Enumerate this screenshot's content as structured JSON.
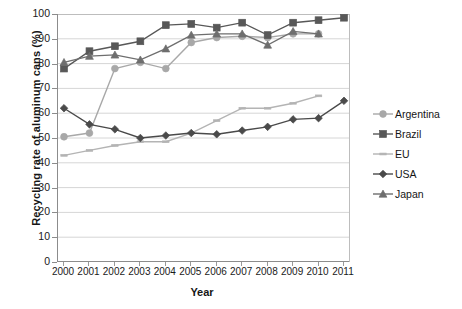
{
  "chart_data": {
    "type": "line",
    "title": "",
    "xlabel": "Year",
    "ylabel": "Recycling rate of aluminum cans (%)",
    "x": [
      2000,
      2001,
      2002,
      2003,
      2004,
      2005,
      2006,
      2007,
      2008,
      2009,
      2010,
      2011
    ],
    "xlim": [
      2000,
      2011
    ],
    "ylim": [
      0,
      100
    ],
    "yticks": [
      0,
      10,
      20,
      30,
      40,
      50,
      60,
      70,
      80,
      90,
      100
    ],
    "xticks": [
      "2000",
      "2001",
      "2002",
      "2003",
      "2004",
      "2005",
      "2006",
      "2007",
      "2008",
      "2009",
      "2010",
      "2011"
    ],
    "grid": true,
    "legend_position": "right",
    "series": [
      {
        "name": "Argentina",
        "marker": "circle",
        "color": "#a8a8a8",
        "values": [
          50.5,
          52,
          78,
          80.5,
          78,
          88.5,
          90.5,
          91,
          90.5,
          92,
          92,
          null
        ]
      },
      {
        "name": "Brazil",
        "marker": "square",
        "color": "#585858",
        "values": [
          78,
          85,
          87,
          89,
          95.5,
          96,
          94.5,
          96.5,
          91.5,
          96.5,
          97.5,
          98.5
        ]
      },
      {
        "name": "EU",
        "marker": "line",
        "color": "#b4b4b4",
        "values": [
          43,
          45,
          47,
          48.5,
          48.5,
          52,
          57,
          62,
          62,
          64,
          67,
          null
        ]
      },
      {
        "name": "USA",
        "marker": "diamond",
        "color": "#4a4a4a",
        "values": [
          62,
          55.5,
          53.5,
          50,
          51,
          52,
          51.5,
          53,
          54.5,
          57.5,
          58,
          65
        ]
      },
      {
        "name": "Japan",
        "marker": "triangle",
        "color": "#6e6e6e",
        "values": [
          80.5,
          83,
          83.5,
          81.5,
          86,
          91.5,
          92,
          92,
          87.5,
          93,
          92,
          null
        ]
      }
    ]
  }
}
